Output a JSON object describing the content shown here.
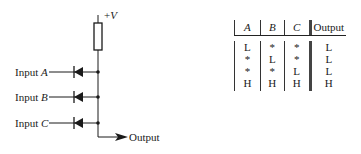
{
  "circuit": {
    "supply_label_prefix": "+",
    "supply_label_var": "V",
    "inputs": [
      {
        "prefix": "Input ",
        "var": "A"
      },
      {
        "prefix": "Input ",
        "var": "B"
      },
      {
        "prefix": "Input ",
        "var": "C"
      }
    ],
    "output_label": "Output",
    "components": [
      "pull-up resistor",
      "diode A",
      "diode B",
      "diode C"
    ]
  },
  "truth_table": {
    "headers": [
      "A",
      "B",
      "C",
      "Output"
    ],
    "rows": [
      [
        "L",
        "*",
        "*",
        "L"
      ],
      [
        "*",
        "L",
        "*",
        "L"
      ],
      [
        "*",
        "*",
        "L",
        "L"
      ],
      [
        "H",
        "H",
        "H",
        "H"
      ]
    ]
  }
}
